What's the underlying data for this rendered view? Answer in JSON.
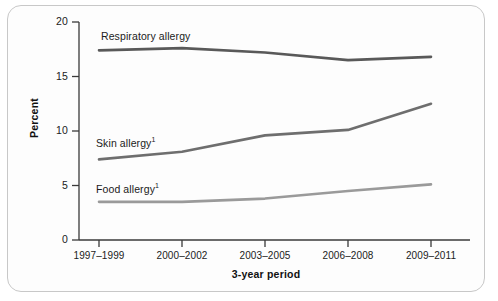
{
  "chart_data": {
    "type": "line",
    "title": "",
    "xlabel": "3-year period",
    "ylabel": "Percent",
    "categories": [
      "1997–1999",
      "2000–2002",
      "2003–2005",
      "2006–2008",
      "2009–2011"
    ],
    "ylim": [
      0,
      20
    ],
    "yticks": [
      0,
      5,
      10,
      15,
      20
    ],
    "ytick_labels": [
      "0",
      "5",
      "10",
      "15",
      "20"
    ],
    "grid": false,
    "legend": "inline-labels",
    "series": [
      {
        "name": "Respiratory allergy",
        "label_text": "Respiratory allergy",
        "footnote_marker": "",
        "color": "#595959",
        "values": [
          17.4,
          17.6,
          17.2,
          16.5,
          16.8
        ]
      },
      {
        "name": "Skin allergy",
        "label_text": "Skin allergy",
        "footnote_marker": "1",
        "color": "#6e6e6e",
        "values": [
          7.4,
          8.1,
          9.6,
          10.1,
          12.5
        ]
      },
      {
        "name": "Food allergy",
        "label_text": "Food allergy",
        "footnote_marker": "1",
        "color": "#9a9a9a",
        "values": [
          3.5,
          3.5,
          3.8,
          4.5,
          5.1
        ]
      }
    ]
  },
  "axes": {
    "y_title": "Percent",
    "x_title": "3-year period",
    "y_tick_labels": [
      "20",
      "15",
      "10",
      "5",
      "0"
    ],
    "x_tick_labels": [
      "1997–1999",
      "2000–2002",
      "2003–2005",
      "2006–2008",
      "2009–2011"
    ]
  },
  "colors": {
    "axis": "#3a3a3a",
    "frame": "#c8c8c8",
    "background": "#fdfdfd",
    "text": "#1b1b1b"
  }
}
